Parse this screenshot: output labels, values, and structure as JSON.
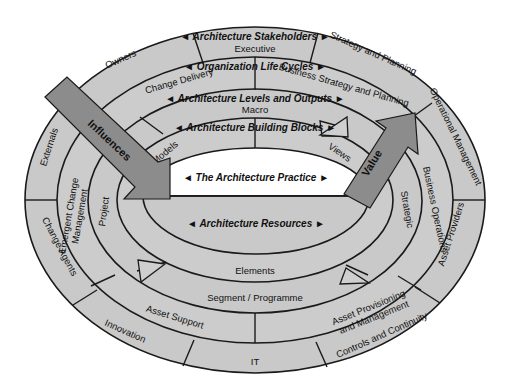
{
  "diagram": {
    "title": "The Architecture Practice",
    "colors": {
      "ring_fill": "#c9c9c9",
      "arrow_fill": "#8c8c8c",
      "hole_fill": "#ffffff",
      "stroke": "#1a1a1a"
    },
    "center": {
      "top_label": "◄ The Architecture Practice ►",
      "bottom_label": "◄ Architecture Resources ►"
    },
    "rings": [
      {
        "name": "Architecture Stakeholders",
        "title": "◄ Architecture Stakeholders ►",
        "segments": [
          "Executive",
          "Strategy and Planning",
          "Operational Management",
          "Asset Providers",
          "Controls and Continuity",
          "IT",
          "Innovation",
          "Change Agents",
          "Externals",
          "Owners"
        ]
      },
      {
        "name": "Organization Life Cycles",
        "title": "◄ Organization Life Cycles ►",
        "segments": [
          "Change Delivery",
          "Business Strategy and Planning",
          "Business Operations",
          "Asset Provisioning and Management",
          "Asset Support",
          "Emergent Change Management"
        ]
      },
      {
        "name": "Architecture Levels and Outputs",
        "title": "◄ Architecture Levels and Outputs ►",
        "segments": [
          "Macro",
          "Strategic",
          "Segment / Programme",
          "Project"
        ]
      },
      {
        "name": "Architecture Building Blocks",
        "title": "◄ Architecture Building Blocks ►",
        "segments": [
          "Models",
          "Views",
          "Elements"
        ]
      }
    ],
    "arrows": {
      "influences": "Influences",
      "value": "Value"
    }
  }
}
